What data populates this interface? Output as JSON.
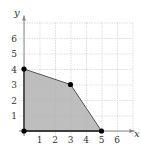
{
  "chart_data": {
    "type": "area",
    "title": "",
    "xlabel": "x",
    "ylabel": "y",
    "xlim": [
      0,
      7
    ],
    "ylim": [
      0,
      7
    ],
    "grid": true,
    "x_ticks": [
      "1",
      "2",
      "3",
      "4",
      "5",
      "6"
    ],
    "y_ticks": [
      "1",
      "2",
      "3",
      "4",
      "5",
      "6"
    ],
    "region": {
      "name": "feasible region",
      "vertices": [
        [
          0,
          0
        ],
        [
          0,
          4
        ],
        [
          3,
          3
        ],
        [
          5,
          0
        ]
      ],
      "fill": "#b3b3b3"
    },
    "points": [
      {
        "x": 0,
        "y": 0
      },
      {
        "x": 0,
        "y": 4
      },
      {
        "x": 3,
        "y": 3
      },
      {
        "x": 5,
        "y": 0
      }
    ],
    "colors": {
      "grid": "#d0d0d0",
      "axis": "#888888",
      "boundary": "#555555",
      "point": "#000000"
    }
  }
}
